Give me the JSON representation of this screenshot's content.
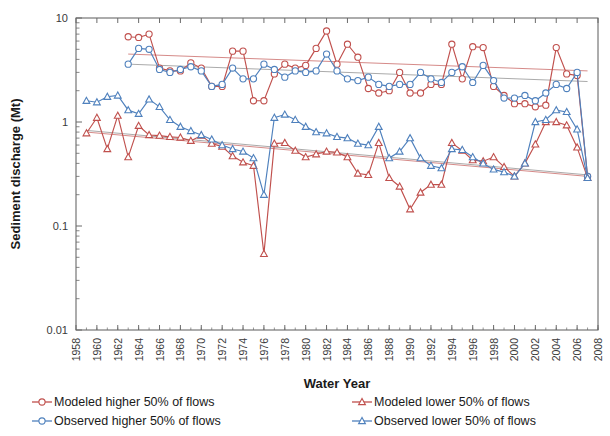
{
  "chart_data": {
    "type": "line",
    "title": "",
    "xlabel": "Water Year",
    "ylabel": "Sediment discharge (Mt)",
    "yscale": "log",
    "ylim": [
      0.01,
      10
    ],
    "ytick_labels": [
      "0.01",
      "0.1",
      "1",
      "10"
    ],
    "ytick_values": [
      0.01,
      0.1,
      1,
      10
    ],
    "xlim": [
      1958,
      2008
    ],
    "xtick_labels": [
      "1958",
      "1960",
      "1962",
      "1964",
      "1966",
      "1968",
      "1970",
      "1972",
      "1974",
      "1976",
      "1978",
      "1980",
      "1982",
      "1984",
      "1986",
      "1988",
      "1990",
      "1992",
      "1994",
      "1996",
      "1998",
      "2000",
      "2002",
      "2004",
      "2006",
      "2008"
    ],
    "xtick_values": [
      1958,
      1960,
      1962,
      1964,
      1966,
      1968,
      1970,
      1972,
      1974,
      1976,
      1978,
      1980,
      1982,
      1984,
      1986,
      1988,
      1990,
      1992,
      1994,
      1996,
      1998,
      2000,
      2002,
      2004,
      2006,
      2008
    ],
    "grid": false,
    "legend_position": "below",
    "colors": {
      "modeled": "#C0504D",
      "observed": "#4F81BD"
    },
    "series": [
      {
        "name": "Modeled higher 50% of flows",
        "color": "#C0504D",
        "marker": "circle",
        "x": [
          1963,
          1964,
          1965,
          1966,
          1967,
          1968,
          1969,
          1970,
          1971,
          1972,
          1973,
          1974,
          1975,
          1976,
          1977,
          1978,
          1979,
          1980,
          1981,
          1982,
          1983,
          1984,
          1985,
          1986,
          1987,
          1988,
          1989,
          1990,
          1991,
          1992,
          1993,
          1994,
          1995,
          1996,
          1997,
          1998,
          1999,
          2000,
          2001,
          2002,
          2003,
          2004,
          2005,
          2006,
          2007
        ],
        "y": [
          6.6,
          6.5,
          7.0,
          3.3,
          3.1,
          3.1,
          3.7,
          3.3,
          2.2,
          2.2,
          4.8,
          4.8,
          1.6,
          1.6,
          2.9,
          3.6,
          3.3,
          3.5,
          5.1,
          7.5,
          3.6,
          5.6,
          4.2,
          2.1,
          1.9,
          2.0,
          3.0,
          1.9,
          1.9,
          2.3,
          2.3,
          5.6,
          2.6,
          5.3,
          5.2,
          2.2,
          1.8,
          1.5,
          1.5,
          1.4,
          1.45,
          5.2,
          2.9,
          2.8,
          0.3
        ]
      },
      {
        "name": "Observed higher 50% of flows",
        "color": "#4F81BD",
        "marker": "circle",
        "x": [
          1963,
          1964,
          1965,
          1966,
          1967,
          1968,
          1969,
          1970,
          1971,
          1972,
          1973,
          1974,
          1975,
          1976,
          1977,
          1978,
          1979,
          1980,
          1981,
          1982,
          1983,
          1984,
          1985,
          1986,
          1987,
          1988,
          1989,
          1990,
          1991,
          1992,
          1993,
          1994,
          1995,
          1996,
          1997,
          1998,
          1999,
          2000,
          2001,
          2002,
          2003,
          2004,
          2005,
          2006,
          2007
        ],
        "y": [
          3.6,
          5.1,
          5.0,
          3.2,
          3.0,
          3.2,
          3.4,
          3.1,
          2.2,
          2.3,
          3.3,
          2.6,
          2.6,
          3.6,
          3.2,
          2.7,
          3.1,
          3.0,
          3.1,
          4.5,
          3.1,
          2.6,
          2.5,
          2.7,
          2.3,
          2.2,
          2.3,
          2.3,
          3.0,
          2.6,
          2.4,
          3.0,
          3.4,
          2.4,
          3.5,
          2.5,
          1.7,
          1.7,
          1.8,
          1.6,
          1.9,
          2.3,
          2.1,
          3.0,
          0.3
        ]
      },
      {
        "name": "Modeled lower 50% of flows",
        "color": "#C0504D",
        "marker": "triangle",
        "x": [
          1959,
          1960,
          1961,
          1962,
          1963,
          1964,
          1965,
          1966,
          1967,
          1968,
          1969,
          1970,
          1971,
          1972,
          1973,
          1974,
          1975,
          1976,
          1977,
          1978,
          1979,
          1980,
          1981,
          1982,
          1983,
          1984,
          1985,
          1986,
          1987,
          1988,
          1989,
          1990,
          1991,
          1992,
          1993,
          1994,
          1995,
          1996,
          1997,
          1998,
          1999,
          2000,
          2001,
          2002,
          2003,
          2004,
          2005,
          2006,
          2007
        ],
        "y": [
          0.78,
          1.1,
          0.55,
          1.15,
          0.46,
          0.92,
          0.75,
          0.74,
          0.72,
          0.71,
          0.66,
          0.74,
          0.62,
          0.58,
          0.47,
          0.41,
          0.38,
          0.054,
          0.62,
          0.63,
          0.53,
          0.46,
          0.49,
          0.52,
          0.51,
          0.46,
          0.32,
          0.31,
          0.63,
          0.29,
          0.24,
          0.145,
          0.21,
          0.25,
          0.25,
          0.63,
          0.53,
          0.43,
          0.42,
          0.46,
          0.37,
          0.3,
          0.4,
          0.61,
          1.0,
          1.0,
          0.93,
          0.57,
          0.29
        ]
      },
      {
        "name": "Observed lower 50% of flows",
        "color": "#4F81BD",
        "marker": "triangle",
        "x": [
          1959,
          1960,
          1961,
          1962,
          1963,
          1964,
          1965,
          1966,
          1967,
          1968,
          1969,
          1970,
          1971,
          1972,
          1973,
          1974,
          1975,
          1976,
          1977,
          1978,
          1979,
          1980,
          1981,
          1982,
          1983,
          1984,
          1985,
          1986,
          1987,
          1988,
          1989,
          1990,
          1991,
          1992,
          1993,
          1994,
          1995,
          1996,
          1997,
          1998,
          1999,
          2000,
          2001,
          2002,
          2003,
          2004,
          2005,
          2006,
          2007
        ],
        "y": [
          1.6,
          1.55,
          1.75,
          1.8,
          1.3,
          1.2,
          1.65,
          1.4,
          1.05,
          0.9,
          0.82,
          0.75,
          0.68,
          0.6,
          0.55,
          0.52,
          0.45,
          0.2,
          1.1,
          1.18,
          1.05,
          0.9,
          0.8,
          0.78,
          0.72,
          0.7,
          0.62,
          0.6,
          0.9,
          0.45,
          0.52,
          0.7,
          0.45,
          0.38,
          0.36,
          0.55,
          0.54,
          0.46,
          0.4,
          0.35,
          0.33,
          0.3,
          0.4,
          1.0,
          1.05,
          1.3,
          1.25,
          0.85,
          0.29
        ]
      }
    ],
    "trendlines": [
      {
        "name": "Modeled higher trend",
        "color": "#C0504D",
        "x": [
          1963,
          2007
        ],
        "y": [
          4.5,
          3.1
        ]
      },
      {
        "name": "Observed higher trend",
        "color": "#808080",
        "x": [
          1963,
          2007
        ],
        "y": [
          3.6,
          2.45
        ]
      },
      {
        "name": "Modeled lower trend",
        "color": "#C0504D",
        "x": [
          1959,
          2007
        ],
        "y": [
          0.8,
          0.3
        ]
      },
      {
        "name": "Observed lower trend",
        "color": "#808080",
        "x": [
          1959,
          2007
        ],
        "y": [
          0.83,
          0.31
        ]
      }
    ]
  },
  "legend": {
    "items": [
      {
        "label": "Modeled higher 50% of flows",
        "color": "#C0504D",
        "marker": "circle"
      },
      {
        "label": "Modeled lower 50% of flows",
        "color": "#C0504D",
        "marker": "triangle"
      },
      {
        "label": "Observed higher 50% of flows",
        "color": "#4F81BD",
        "marker": "circle"
      },
      {
        "label": "Observed lower 50% of flows",
        "color": "#4F81BD",
        "marker": "triangle"
      }
    ]
  }
}
